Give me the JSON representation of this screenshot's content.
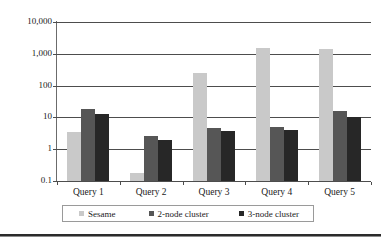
{
  "chart_data": {
    "type": "bar",
    "title": "",
    "xlabel": "",
    "ylabel": "",
    "yscale": "log",
    "ylim": [
      0.1,
      10000
    ],
    "grid": true,
    "legend_position": "bottom",
    "categories": [
      "Query 1",
      "Query 2",
      "Query 3",
      "Query 4",
      "Query 5"
    ],
    "ytick_labels": [
      "10,000",
      "1,000",
      "100",
      "10",
      "1",
      "0.1"
    ],
    "ytick_values": [
      10000,
      1000,
      100,
      10,
      1,
      0.1
    ],
    "series": [
      {
        "name": "Sesame",
        "color": "#c9c9c9",
        "values": [
          3.6,
          0.18,
          250,
          1500,
          1450
        ]
      },
      {
        "name": "2-node cluster",
        "color": "#565656",
        "values": [
          18,
          2.6,
          4.8,
          5.0,
          15.5
        ]
      },
      {
        "name": "3-node cluster",
        "color": "#272727",
        "values": [
          12.5,
          2.0,
          3.7,
          4.0,
          10.5
        ]
      }
    ]
  },
  "legend": {
    "items": [
      {
        "label": "Sesame"
      },
      {
        "label": "2-node cluster"
      },
      {
        "label": "3-node cluster"
      }
    ]
  }
}
